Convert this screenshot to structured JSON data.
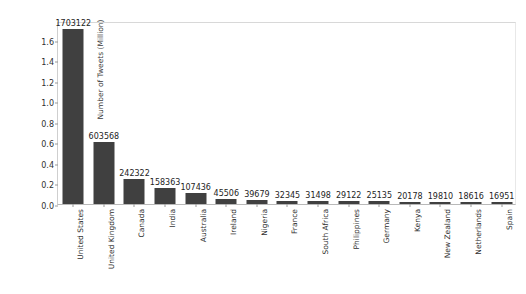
{
  "figure": {
    "clipped_title": "",
    "bar_color": "#404040",
    "background_color": "#ffffff"
  },
  "chart_data": {
    "type": "bar",
    "title": "",
    "xlabel": "",
    "ylabel": "Number of Tweets (Million)",
    "categories": [
      "United States",
      "United Kingdom",
      "Canada",
      "India",
      "Australia",
      "Ireland",
      "Nigeria",
      "France",
      "South Africa",
      "Philippines",
      "Germany",
      "Kenya",
      "New Zealand",
      "Netherlands",
      "Spain"
    ],
    "values": [
      1703122,
      603568,
      242322,
      158363,
      107436,
      45506,
      39679,
      32345,
      31498,
      29122,
      25135,
      20178,
      19810,
      18616,
      16951
    ],
    "value_labels": [
      "1703122",
      "603568",
      "242322",
      "158363",
      "107436",
      "45506",
      "39679",
      "32345",
      "31498",
      "29122",
      "25135",
      "20178",
      "19810",
      "18616",
      "16951"
    ],
    "yticks": [
      0.0,
      0.2,
      0.4,
      0.6,
      0.8,
      1.0,
      1.2,
      1.4,
      1.6
    ],
    "ytick_labels": [
      "0.0",
      "0.2",
      "0.4",
      "0.6",
      "0.8",
      "1.0",
      "1.2",
      "1.4",
      "1.6"
    ],
    "ylim": [
      0,
      1.78
    ],
    "y_unit_scale": 1000000,
    "grid": false,
    "legend": null
  }
}
